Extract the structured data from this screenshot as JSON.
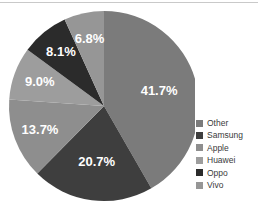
{
  "chart_data": {
    "type": "pie",
    "title": "",
    "subtitle": "",
    "xlabel": "",
    "ylabel": "",
    "legend_position": "right",
    "grid": false,
    "start_angle_deg": 0,
    "direction": "clockwise",
    "categories": [
      "Other",
      "Samsung",
      "Apple",
      "Huawei",
      "Oppo",
      "Vivo"
    ],
    "values": [
      41.7,
      20.7,
      13.7,
      9.0,
      8.1,
      6.8
    ],
    "value_unit": "%",
    "slices": [
      {
        "label": "Other",
        "value": 41.7,
        "data_label": "41.7%",
        "color": "#7b7b7b"
      },
      {
        "label": "Samsung",
        "value": 20.7,
        "data_label": "20.7%",
        "color": "#3e3e3e"
      },
      {
        "label": "Apple",
        "value": 13.7,
        "data_label": "13.7%",
        "color": "#8e8e8e"
      },
      {
        "label": "Huawei",
        "value": 9.0,
        "data_label": "9.0%",
        "color": "#9d9d9d"
      },
      {
        "label": "Oppo",
        "value": 8.1,
        "data_label": "8.1%",
        "color": "#2b2b2b"
      },
      {
        "label": "Vivo",
        "value": 6.8,
        "data_label": "6.8%",
        "color": "#969696"
      }
    ]
  },
  "legend": {
    "items": [
      {
        "label": "Other",
        "color": "#7b7b7b"
      },
      {
        "label": "Samsung",
        "color": "#3e3e3e"
      },
      {
        "label": "Apple",
        "color": "#8e8e8e"
      },
      {
        "label": "Huawei",
        "color": "#9d9d9d"
      },
      {
        "label": "Oppo",
        "color": "#2b2b2b"
      },
      {
        "label": "Vivo",
        "color": "#969696"
      }
    ]
  },
  "style": {
    "background": "#ffffff",
    "label_text_color": "#ffffff",
    "legend_text_color": "#3a3a3a",
    "rule_color": "#c9c9c9"
  },
  "geometry": {
    "center_x": 104,
    "center_y": 106,
    "radius": 95
  }
}
